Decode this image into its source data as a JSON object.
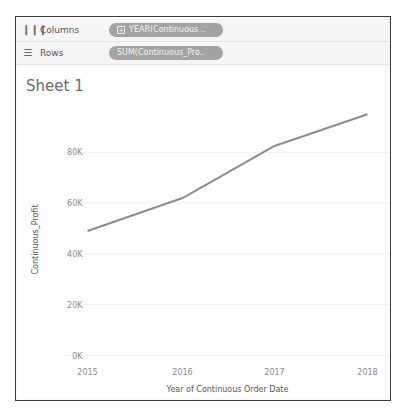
{
  "shelves": {
    "columns": {
      "label": "Columns",
      "icon": "columns-icon",
      "pill": "YEAR(Continuous ..",
      "pill_icon": "expand-plus-icon"
    },
    "rows": {
      "label": "Rows",
      "icon": "rows-icon",
      "pill": "SUM(Continuous_Pro.."
    }
  },
  "sheet": {
    "title": "Sheet 1"
  },
  "colors": {
    "line": "#8c8c8c",
    "pill": "#a3a3a3",
    "frame": "#3a3a3a",
    "axis_text": "#8a8a8a"
  },
  "chart_data": {
    "type": "line",
    "title": "Sheet 1",
    "xlabel": "Year of Continuous Order Date",
    "ylabel": "Continuous_Profit",
    "categories": [
      "2015",
      "2016",
      "2017",
      "2018"
    ],
    "x": [
      2015,
      2016,
      2017,
      2018
    ],
    "values": [
      49000,
      62000,
      82500,
      95000
    ],
    "series": [
      {
        "name": "SUM(Continuous_Profit)",
        "values": [
          49000,
          62000,
          82500,
          95000
        ]
      }
    ],
    "ylim": [
      0,
      95000
    ],
    "yticks": [
      0,
      20000,
      40000,
      60000,
      80000
    ],
    "ytick_labels": [
      "0K",
      "20K",
      "40K",
      "60K",
      "80K"
    ],
    "grid": true,
    "legend": "none"
  }
}
